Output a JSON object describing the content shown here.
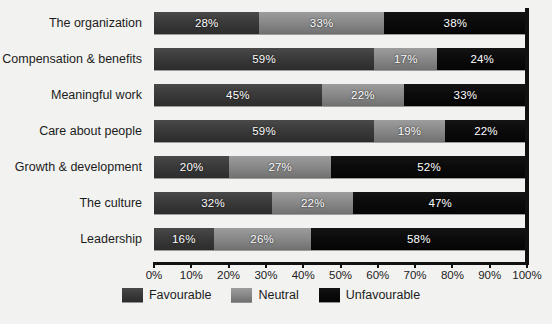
{
  "chart_data": {
    "type": "bar",
    "subtype": "stacked-horizontal-100",
    "title": "",
    "xlabel": "",
    "ylabel": "",
    "xlim": [
      0,
      100
    ],
    "grid": false,
    "legend_position": "bottom-center",
    "categories": [
      "The organization",
      "Compensation & benefits",
      "Meaningful work",
      "Care about people",
      "Growth & development",
      "The culture",
      "Leadership"
    ],
    "series": [
      {
        "name": "Favourable",
        "color": "#3a3a3a",
        "values": [
          28,
          59,
          45,
          59,
          20,
          32,
          16
        ],
        "labels": [
          "28%",
          "59%",
          "45%",
          "59%",
          "20%",
          "32%",
          "16%"
        ]
      },
      {
        "name": "Neutral",
        "color": "#8a8a8a",
        "values": [
          33,
          17,
          22,
          19,
          27,
          22,
          26
        ],
        "labels": [
          "33%",
          "17%",
          "22%",
          "19%",
          "27%",
          "22%",
          "26%"
        ]
      },
      {
        "name": "Unfavourable",
        "color": "#0b0b0b",
        "values": [
          38,
          24,
          33,
          22,
          52,
          47,
          58
        ],
        "labels": [
          "38%",
          "24%",
          "33%",
          "22%",
          "52%",
          "47%",
          "58%"
        ]
      }
    ],
    "x_ticks": [
      0,
      10,
      20,
      30,
      40,
      50,
      60,
      70,
      80,
      90,
      100
    ],
    "x_tick_labels": [
      "0%",
      "10%",
      "20%",
      "30%",
      "40%",
      "50%",
      "60%",
      "70%",
      "80%",
      "90%",
      "100%"
    ]
  },
  "legend": {
    "items": [
      {
        "label": "Favourable",
        "color": "#3a3a3a"
      },
      {
        "label": "Neutral",
        "color": "#8a8a8a"
      },
      {
        "label": "Unfavourable",
        "color": "#0b0b0b"
      }
    ]
  }
}
